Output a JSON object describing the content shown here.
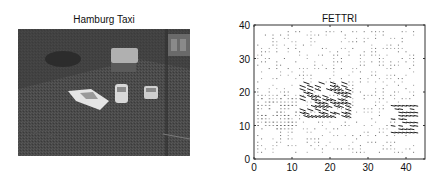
{
  "left_panel": {
    "title": "Hamburg Taxi",
    "image_description": "grayscale street intersection photo with taxis"
  },
  "chart_data": {
    "type": "quiver",
    "title": "FETTRI",
    "xlabel": "",
    "ylabel": "",
    "xlim": [
      0,
      45
    ],
    "ylim": [
      0,
      40
    ],
    "xticks": [
      0,
      10,
      20,
      30,
      40
    ],
    "yticks": [
      0,
      10,
      20,
      30,
      40
    ],
    "xtick_labels": [
      "0",
      "10",
      "20",
      "30",
      "40"
    ],
    "ytick_labels": [
      "0",
      "10",
      "20",
      "30",
      "40"
    ],
    "grid": false,
    "grid_spacing": 1,
    "grid_range": {
      "x": [
        1,
        42
      ],
      "y": [
        2,
        38
      ]
    },
    "motion_regions": [
      {
        "name": "center-taxi",
        "x_range": [
          12,
          24
        ],
        "y_range": [
          13,
          23
        ],
        "direction": "down-right",
        "magnitude": "large"
      },
      {
        "name": "right-taxi",
        "x_range": [
          36,
          42
        ],
        "y_range": [
          8,
          16
        ],
        "direction": "left-down",
        "magnitude": "medium"
      },
      {
        "name": "left-car",
        "x_range": [
          1,
          11
        ],
        "y_range": [
          9,
          19
        ],
        "direction": "mixed",
        "magnitude": "small"
      }
    ],
    "background_noise": "sparse small dots across full grid"
  },
  "colors": {
    "arrow": "#222222",
    "axis": "#333333",
    "background": "#ffffff"
  }
}
